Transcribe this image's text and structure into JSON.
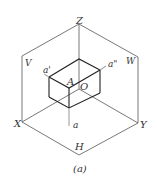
{
  "figure": {
    "caption": "(a)",
    "axis_labels": {
      "x": "X",
      "y": "Y",
      "z": "Z"
    },
    "plane_labels": {
      "v": "V",
      "w": "W",
      "h": "H"
    },
    "origin_label": "O",
    "point_label": "A",
    "projection_labels": {
      "front": "a'",
      "side": "a\"",
      "top": "a"
    },
    "colors": {
      "line": "#444444",
      "projector": "#999999",
      "background": "#ffffff"
    }
  }
}
